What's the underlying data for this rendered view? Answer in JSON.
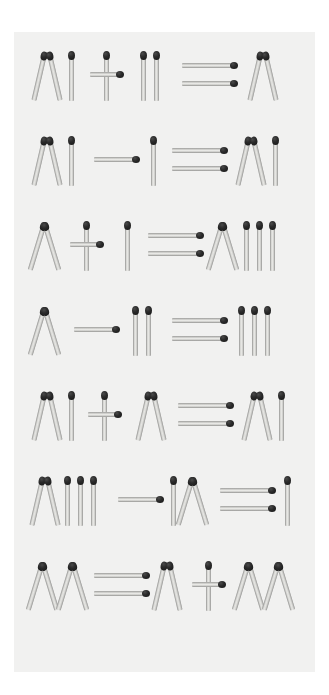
{
  "page": {
    "background_color": "#ffffff",
    "paper_color": "#f1f1f0",
    "match_head_color": "#1b1b1b",
    "match_stick_color": "#d9d9d6"
  },
  "legend": {
    "symbol_names": {
      "V": "roman-five",
      "I": "roman-one",
      "X": "roman-ten",
      "plus": "plus-sign",
      "minus": "minus-sign",
      "equals": "equals-sign"
    }
  },
  "puzzles": [
    {
      "index": 1,
      "equation": "VI + II = V",
      "left_operand": "VI",
      "operator": "+",
      "right_operand": "II",
      "result": "V",
      "tokens": [
        {
          "kind": "numeral",
          "text": "VI",
          "glyphs": [
            "V",
            "I"
          ]
        },
        {
          "kind": "operator",
          "text": "+"
        },
        {
          "kind": "numeral",
          "text": "II",
          "glyphs": [
            "I",
            "I"
          ]
        },
        {
          "kind": "operator",
          "text": "="
        },
        {
          "kind": "numeral",
          "text": "V",
          "glyphs": [
            "V"
          ]
        }
      ]
    },
    {
      "index": 2,
      "equation": "VI - I = VI",
      "left_operand": "VI",
      "operator": "-",
      "right_operand": "I",
      "result": "VI",
      "tokens": [
        {
          "kind": "numeral",
          "text": "VI",
          "glyphs": [
            "V",
            "I"
          ]
        },
        {
          "kind": "operator",
          "text": "-"
        },
        {
          "kind": "numeral",
          "text": "I",
          "glyphs": [
            "I"
          ]
        },
        {
          "kind": "operator",
          "text": "="
        },
        {
          "kind": "numeral",
          "text": "VI",
          "glyphs": [
            "V",
            "I"
          ]
        }
      ]
    },
    {
      "index": 3,
      "equation": "X + I = XIII",
      "left_operand": "X",
      "operator": "+",
      "right_operand": "I",
      "result": "XIII",
      "tokens": [
        {
          "kind": "numeral",
          "text": "X",
          "glyphs": [
            "X"
          ]
        },
        {
          "kind": "operator",
          "text": "+"
        },
        {
          "kind": "numeral",
          "text": "I",
          "glyphs": [
            "I"
          ]
        },
        {
          "kind": "operator",
          "text": "="
        },
        {
          "kind": "numeral",
          "text": "XIII",
          "glyphs": [
            "X",
            "I",
            "I",
            "I"
          ]
        }
      ]
    },
    {
      "index": 4,
      "equation": "X - II = III",
      "left_operand": "X",
      "operator": "-",
      "right_operand": "II",
      "result": "III",
      "tokens": [
        {
          "kind": "numeral",
          "text": "X",
          "glyphs": [
            "X"
          ]
        },
        {
          "kind": "operator",
          "text": "-"
        },
        {
          "kind": "numeral",
          "text": "II",
          "glyphs": [
            "I",
            "I"
          ]
        },
        {
          "kind": "operator",
          "text": "="
        },
        {
          "kind": "numeral",
          "text": "III",
          "glyphs": [
            "I",
            "I",
            "I"
          ]
        }
      ]
    },
    {
      "index": 5,
      "equation": "VI + V = VI",
      "left_operand": "VI",
      "operator": "+",
      "right_operand": "V",
      "result": "VI",
      "tokens": [
        {
          "kind": "numeral",
          "text": "VI",
          "glyphs": [
            "V",
            "I"
          ]
        },
        {
          "kind": "operator",
          "text": "+"
        },
        {
          "kind": "numeral",
          "text": "V",
          "glyphs": [
            "V"
          ]
        },
        {
          "kind": "operator",
          "text": "="
        },
        {
          "kind": "numeral",
          "text": "VI",
          "glyphs": [
            "V",
            "I"
          ]
        }
      ]
    },
    {
      "index": 6,
      "equation": "VIII - IX = I",
      "left_operand": "VIII",
      "operator": "-",
      "right_operand": "IX",
      "result": "I",
      "tokens": [
        {
          "kind": "numeral",
          "text": "VIII",
          "glyphs": [
            "V",
            "I",
            "I",
            "I"
          ]
        },
        {
          "kind": "operator",
          "text": "-"
        },
        {
          "kind": "numeral",
          "text": "IX",
          "glyphs": [
            "I",
            "X"
          ]
        },
        {
          "kind": "operator",
          "text": "="
        },
        {
          "kind": "numeral",
          "text": "I",
          "glyphs": [
            "I"
          ]
        }
      ]
    },
    {
      "index": 7,
      "equation": "XX = V + XX",
      "left_operand": "XX",
      "operator": "=",
      "right_operand": "V + XX",
      "result": "XX",
      "tokens": [
        {
          "kind": "numeral",
          "text": "XX",
          "glyphs": [
            "X",
            "X"
          ]
        },
        {
          "kind": "operator",
          "text": "="
        },
        {
          "kind": "numeral",
          "text": "V",
          "glyphs": [
            "V"
          ]
        },
        {
          "kind": "operator",
          "text": "+"
        },
        {
          "kind": "numeral",
          "text": "XX",
          "glyphs": [
            "X",
            "X"
          ]
        }
      ]
    }
  ],
  "layout": {
    "rows_y": [
      44,
      129,
      214,
      299,
      384,
      469,
      554
    ],
    "row_positions": [
      {
        "row": 1,
        "token_x": [
          22,
          76,
          128,
          176,
          244
        ]
      },
      {
        "row": 2,
        "token_x": [
          22,
          78,
          132,
          158,
          222
        ]
      },
      {
        "row": 3,
        "token_x": [
          20,
          66,
          116,
          142,
          196
        ]
      },
      {
        "row": 4,
        "token_x": [
          22,
          72,
          124,
          160,
          220
        ]
      },
      {
        "row": 5,
        "token_x": [
          22,
          76,
          128,
          176,
          238
        ]
      },
      {
        "row": 6,
        "token_x": [
          20,
          94,
          148,
          194,
          256
        ]
      },
      {
        "row": 7,
        "token_x": [
          18,
          80,
          136,
          180,
          226
        ]
      }
    ]
  }
}
